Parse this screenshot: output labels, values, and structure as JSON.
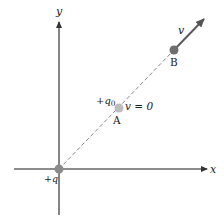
{
  "diagram": {
    "axes": {
      "x_label": "x",
      "y_label": "y"
    },
    "charges": {
      "source": {
        "label": "+q",
        "position": "origin"
      },
      "test": {
        "label_prefix": "+q",
        "label_sub": "0"
      }
    },
    "points": {
      "A": {
        "label": "A",
        "velocity_label": "v = 0"
      },
      "B": {
        "label": "B",
        "velocity_label": "v"
      }
    },
    "colors": {
      "axis": "#555555",
      "charge_dot": "#8a8a8a",
      "point_A_dot": "#bdbdbd",
      "point_B_dot": "#6e6e6e",
      "dashed_path": "#777777",
      "velocity_arrow": "#555555",
      "text": "#222222"
    }
  }
}
